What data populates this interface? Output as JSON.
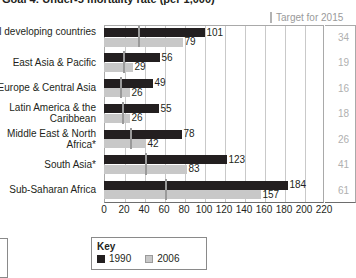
{
  "chart_data": {
    "type": "bar",
    "orientation": "horizontal",
    "title": "Goal 4: Under-5 mortality rate (per 1,000)",
    "xlabel": "",
    "ylabel": "",
    "xlim": [
      0,
      220
    ],
    "xticks": [
      0,
      20,
      40,
      60,
      80,
      100,
      120,
      140,
      160,
      180,
      200,
      220
    ],
    "grid": true,
    "legend_position": "bottom",
    "categories": [
      "All developing countries",
      "East Asia & Pacific",
      "Europe & Central Asia",
      "Latin America & the Caribbean",
      "Middle East & North Africa*",
      "South Asia*",
      "Sub-Saharan Africa"
    ],
    "series": [
      {
        "name": "1990",
        "color": "#231f20",
        "values": [
          101,
          56,
          49,
          55,
          78,
          123,
          184
        ]
      },
      {
        "name": "2006",
        "color": "#c8c8c8",
        "values": [
          79,
          29,
          26,
          26,
          42,
          83,
          157
        ]
      }
    ],
    "target_series": {
      "name": "Target for 2015",
      "color": "#9a9a9a",
      "values": [
        34,
        19,
        16,
        18,
        26,
        41,
        61
      ]
    }
  },
  "title": "Goal 4: Under-5 mortality rate (per 1,000)",
  "target_header": {
    "label": "Target for 2015",
    "tick_icon": "vertical-tick-icon"
  },
  "legend": {
    "title": "Key",
    "items": [
      {
        "label": "1990",
        "color": "#231f20"
      },
      {
        "label": "2006",
        "color": "#c8c8c8"
      }
    ]
  }
}
